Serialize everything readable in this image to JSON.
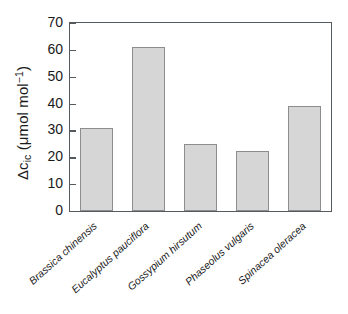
{
  "chart_data": {
    "type": "bar",
    "title": "",
    "xlabel": "",
    "ylabel": "Δc_ic (μmol mol⁻¹)",
    "ylabel_parts": {
      "prefix": "Δc",
      "subscript": "ic",
      "units_open": " (μmol mol",
      "superscript": "−1",
      "units_close": ")"
    },
    "categories": [
      "Brassica chinensis",
      "Eucalyptus pauciflora",
      "Gossypium hirsutum",
      "Phaseolus vulgaris",
      "Spinacea oleracea"
    ],
    "values": [
      31,
      61,
      25,
      22.5,
      39
    ],
    "ylim": [
      0,
      70
    ],
    "ytick_values": [
      0,
      10,
      20,
      30,
      40,
      50,
      60,
      70
    ],
    "ytick_labels": [
      "0",
      "10",
      "20",
      "30",
      "40",
      "50",
      "60",
      "70"
    ],
    "grid": false,
    "legend": null,
    "bar_fill_color": "#d6d6d6",
    "bar_edge_color": "#8d8d8d",
    "axis_color": "#555a5e",
    "text_color": "#1a1a1a",
    "tick_direction": "in",
    "frame": "box"
  }
}
